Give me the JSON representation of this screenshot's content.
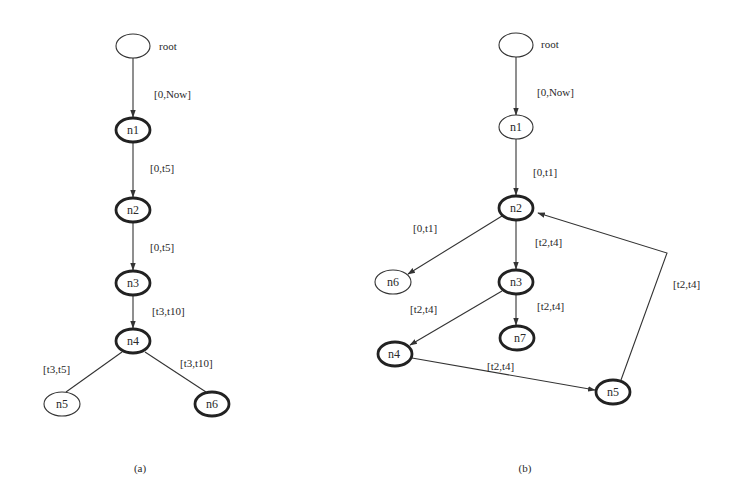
{
  "figure": {
    "panels": [
      {
        "id": "a",
        "caption": "(a)",
        "root_label": "root",
        "nodes": [
          {
            "id": "root",
            "label": "",
            "x": 133,
            "y": 46,
            "bold": false
          },
          {
            "id": "n1",
            "label": "n1",
            "x": 133,
            "y": 130,
            "bold": true
          },
          {
            "id": "n2",
            "label": "n2",
            "x": 133,
            "y": 210,
            "bold": true
          },
          {
            "id": "n3",
            "label": "n3",
            "x": 133,
            "y": 283,
            "bold": true
          },
          {
            "id": "n4",
            "label": "n4",
            "x": 133,
            "y": 341,
            "bold": true
          },
          {
            "id": "n5",
            "label": "n5",
            "x": 62,
            "y": 404,
            "bold": false
          },
          {
            "id": "n6",
            "label": "n6",
            "x": 212,
            "y": 404,
            "bold": true
          }
        ],
        "edges": [
          {
            "from": "root",
            "to": "n1",
            "label": "[0,Now]",
            "arrow": true
          },
          {
            "from": "n1",
            "to": "n2",
            "label": "[0,t5]",
            "arrow": true
          },
          {
            "from": "n2",
            "to": "n3",
            "label": "[0,t5]",
            "arrow": true
          },
          {
            "from": "n3",
            "to": "n4",
            "label": "[t3,t10]",
            "arrow": true
          },
          {
            "from": "n4",
            "to": "n5",
            "label": "[t3,t5]",
            "arrow": false
          },
          {
            "from": "n4",
            "to": "n6",
            "label": "[t3,t10]",
            "arrow": false
          }
        ]
      },
      {
        "id": "b",
        "caption": "(b)",
        "root_label": "root",
        "nodes": [
          {
            "id": "root",
            "label": "",
            "x": 516,
            "y": 45,
            "bold": false
          },
          {
            "id": "n1",
            "label": "n1",
            "x": 516,
            "y": 127,
            "bold": false
          },
          {
            "id": "n2",
            "label": "n2",
            "x": 516,
            "y": 208,
            "bold": true
          },
          {
            "id": "n6",
            "label": "n6",
            "x": 393,
            "y": 282,
            "bold": false
          },
          {
            "id": "n3",
            "label": "n3",
            "x": 516,
            "y": 282,
            "bold": true
          },
          {
            "id": "n7",
            "label": "n7",
            "x": 517,
            "y": 338,
            "bold": true
          },
          {
            "id": "n4",
            "label": "n4",
            "x": 395,
            "y": 354,
            "bold": true
          },
          {
            "id": "n5",
            "label": "n5",
            "x": 613,
            "y": 392,
            "bold": true
          }
        ],
        "edges": [
          {
            "from": "root",
            "to": "n1",
            "label": "[0,Now]",
            "arrow": true
          },
          {
            "from": "n1",
            "to": "n2",
            "label": "[0,t1]",
            "arrow": true
          },
          {
            "from": "n2",
            "to": "n6",
            "label": "[0,t1]",
            "arrow": true
          },
          {
            "from": "n2",
            "to": "n3",
            "label": "[t2,t4]",
            "arrow": true
          },
          {
            "from": "n3",
            "to": "n4",
            "label": "[t2,t4]",
            "arrow": true
          },
          {
            "from": "n3",
            "to": "n7",
            "label": "[t2,t4]",
            "arrow": true
          },
          {
            "from": "n4",
            "to": "n5",
            "label": "[t2,t4]",
            "arrow": true
          },
          {
            "from": "n5",
            "to": "n2",
            "label": "[t2,t4]",
            "arrow": true,
            "bend": [
              667,
              253
            ]
          }
        ]
      }
    ]
  }
}
